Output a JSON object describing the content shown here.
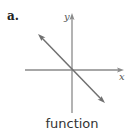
{
  "panel_label": "a.",
  "axes": {
    "x_label": "x",
    "y_label": "y"
  },
  "caption": "function",
  "colors": {
    "axis": "#808080",
    "line": "#6e6e6e",
    "text": "#333333"
  }
}
